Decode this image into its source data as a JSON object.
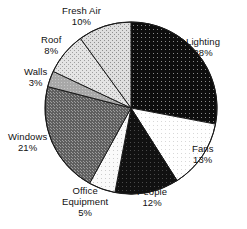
{
  "chart_data": {
    "type": "pie",
    "title": "",
    "xlabel": "",
    "ylabel": "",
    "legend_position": "none",
    "grid": false,
    "labels_outside": true,
    "start_angle_deg": 0,
    "direction": "clockwise",
    "center": {
      "x": 131,
      "y": 108
    },
    "radius": 86,
    "categories": [
      "Lighting",
      "Fans",
      "People",
      "Office Equipment",
      "Windows",
      "Walls",
      "Roof",
      "Fresh Air"
    ],
    "values": [
      28,
      13,
      12,
      5,
      21,
      3,
      8,
      10
    ],
    "unit": "%",
    "slices": [
      {
        "name": "Lighting",
        "label": "Lighting",
        "value": 28,
        "percent_text": "28%",
        "fill": "#0d0d0d",
        "pattern": "black-with-white-dots"
      },
      {
        "name": "Fans",
        "label": "Fans",
        "value": 13,
        "percent_text": "13%",
        "fill": "#fbfbfb",
        "pattern": "white-with-light-dots"
      },
      {
        "name": "People",
        "label": "People",
        "value": 12,
        "percent_text": "12%",
        "fill": "#111111",
        "pattern": "solid-black"
      },
      {
        "name": "Office Equipment",
        "label": "Office\nEquipment",
        "label_line1": "Office",
        "label_line2": "Equipment",
        "value": 5,
        "percent_text": "5%",
        "fill": "#f2f2f2",
        "pattern": "very-light-dots"
      },
      {
        "name": "Windows",
        "label": "Windows",
        "value": 21,
        "percent_text": "21%",
        "fill": "#6e6e6e",
        "pattern": "dark-gray-checker"
      },
      {
        "name": "Walls",
        "label": "Walls",
        "value": 3,
        "percent_text": "3%",
        "fill": "#a8a8a8",
        "pattern": "medium-gray"
      },
      {
        "name": "Roof",
        "label": "Roof",
        "value": 8,
        "percent_text": "8%",
        "fill": "#dcdcdc",
        "pattern": "light-gray-hatch"
      },
      {
        "name": "Fresh Air",
        "label": "Fresh Air",
        "value": 10,
        "percent_text": "10%",
        "fill": "#d0d0d0",
        "pattern": "light-crosshatch"
      }
    ]
  },
  "colors": {
    "background": "#ffffff",
    "outline": "#1a1a1a",
    "text": "#111111"
  }
}
